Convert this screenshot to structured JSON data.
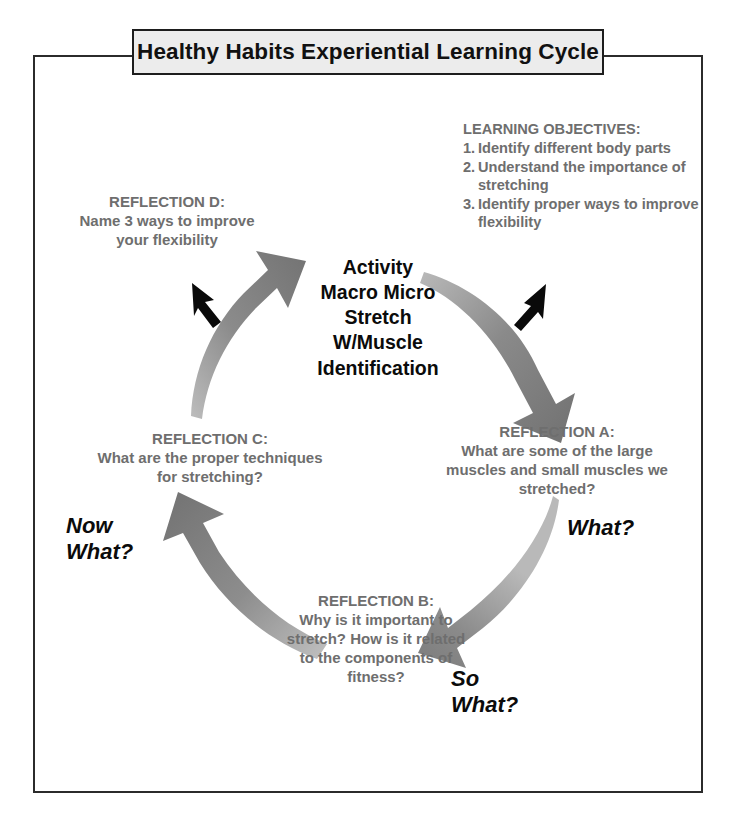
{
  "title": {
    "text": "Healthy Habits Experiential Learning Cycle"
  },
  "objectives": {
    "heading": "LEARNING OBJECTIVES:",
    "items": [
      {
        "num": "1.",
        "text": "Identify different body parts"
      },
      {
        "num": "2.",
        "text": "Understand the importance of stretching"
      },
      {
        "num": "3.",
        "text": "Identify proper ways to improve flexibility"
      }
    ]
  },
  "center": {
    "lines": [
      "Activity",
      "Macro Micro",
      "Stretch",
      "W/Muscle",
      "Identification"
    ]
  },
  "reflections": {
    "d": {
      "label": "REFLECTION D:",
      "text": "Name 3 ways to improve your flexibility"
    },
    "a": {
      "label": "REFLECTION A:",
      "text": "What are some of the large muscles and small muscles we stretched?"
    },
    "b": {
      "label": "REFLECTION B:",
      "text": "Why is it important to stretch? How is it related to the components of fitness?"
    },
    "c": {
      "label": "REFLECTION C:",
      "text": "What are the proper techniques for stretching?"
    }
  },
  "prompts": {
    "what": {
      "line1": "What?"
    },
    "so": {
      "line1": "So",
      "line2": "What?"
    },
    "now": {
      "line1": "Now",
      "line2": "What?"
    }
  },
  "colors": {
    "text_gray": "#6e6e6e",
    "text_black": "#0b0b0b",
    "arrow_gray": "#7c7c7c",
    "banner_fill": "#ececec",
    "frame_stroke": "#2b2b2b"
  }
}
